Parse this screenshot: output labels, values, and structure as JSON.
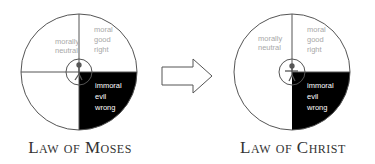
{
  "diagrams": [
    {
      "caption": "Law of Moses",
      "quadrants": {
        "top_left": [
          "morally",
          "neutral"
        ],
        "top_right": [
          "moral",
          "good",
          "right"
        ],
        "bottom_right": [
          "immoral",
          "evil",
          "wrong"
        ]
      }
    },
    {
      "caption": "Law of Christ",
      "quadrants": {
        "top_left": [
          "morally",
          "neutral"
        ],
        "top_right": [
          "moral",
          "good",
          "right"
        ],
        "bottom_right": [
          "immoral",
          "evil",
          "wrong"
        ]
      }
    }
  ],
  "arrow": "right-arrow",
  "colors": {
    "stroke": "#555555",
    "fill_black": "#000000",
    "label_gray": "#a8a8a8",
    "label_white": "#ffffff"
  }
}
